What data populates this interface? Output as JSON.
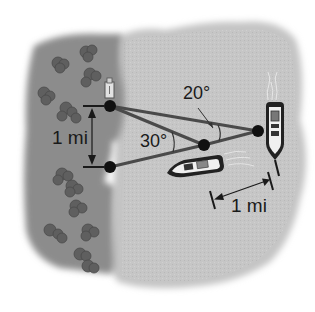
{
  "diagram": {
    "type": "triangulation-distance-diagram",
    "labels": {
      "shore_distance": "1 mi",
      "boat_distance": "1 mi",
      "angle_small": "20°",
      "angle_large": "30°"
    },
    "points": {
      "shore_top": {
        "x": 110,
        "y": 106
      },
      "shore_bottom": {
        "x": 110,
        "y": 167
      },
      "near_boat": {
        "x": 204,
        "y": 145
      },
      "far_boat": {
        "x": 258,
        "y": 131
      }
    },
    "colors": {
      "land": "#8a8a8a",
      "water": "#c4c4c4",
      "line": "#4a4a4a",
      "dot": "#111111",
      "text": "#1a1a1a",
      "background": "#ffffff"
    }
  }
}
